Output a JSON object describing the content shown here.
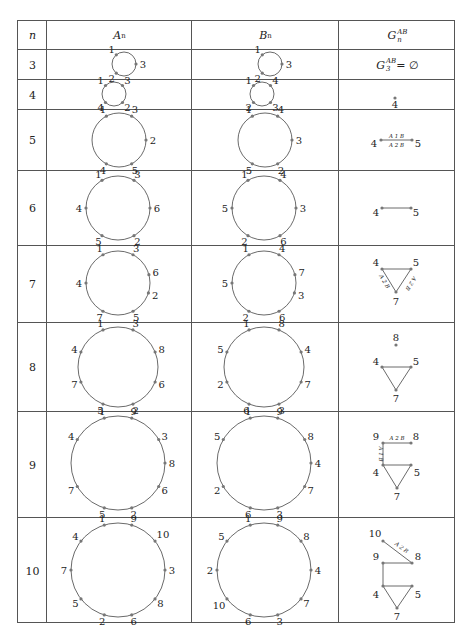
{
  "table": {
    "headers": {
      "n": "n",
      "a": "A",
      "a_sub": "n",
      "b": "B",
      "b_sub": "n",
      "g": "G",
      "g_sub": "n",
      "g_sup": "AB"
    },
    "rows": [
      {
        "n": "3",
        "A": {
          "cx": 124,
          "cy": 64,
          "r": 12,
          "nodes": [
            {
              "l": "1",
              "a": -130
            },
            {
              "l": "3",
              "a": 0
            },
            {
              "l": "2",
              "a": 130
            }
          ]
        },
        "B": {
          "cx": 270,
          "cy": 64,
          "r": 12,
          "nodes": [
            {
              "l": "1",
              "a": -130
            },
            {
              "l": "3",
              "a": 0
            },
            {
              "l": "2",
              "a": 130
            }
          ]
        },
        "G": {
          "text_main": "G",
          "text_sub": "3",
          "text_sup": "AB",
          "text_rest": " = ∅"
        }
      },
      {
        "n": "4",
        "A": {
          "cx": 114,
          "cy": 94,
          "r": 12,
          "nodes": [
            {
              "l": "1",
              "a": -135
            },
            {
              "l": "3",
              "a": -45
            },
            {
              "l": "2",
              "a": 45
            },
            {
              "l": "4",
              "a": 135
            }
          ]
        },
        "B": {
          "cx": 262,
          "cy": 94,
          "r": 12,
          "nodes": [
            {
              "l": "1",
              "a": -135
            },
            {
              "l": "4",
              "a": -45
            },
            {
              "l": "3",
              "a": 45
            },
            {
              "l": "2",
              "a": 135
            }
          ]
        },
        "G": {
          "nodes": [
            {
              "l": "4",
              "x": 395,
              "y": 98,
              "lx": 395,
              "ly": 108
            }
          ],
          "edges": []
        }
      },
      {
        "n": "5",
        "A": {
          "cx": 119,
          "cy": 140,
          "r": 27,
          "nodes": [
            {
              "l": "1",
              "a": -118
            },
            {
              "l": "3",
              "a": -62
            },
            {
              "l": "2",
              "a": 0
            },
            {
              "l": "5",
              "a": 62
            },
            {
              "l": "4",
              "a": 118
            }
          ]
        },
        "B": {
          "cx": 265,
          "cy": 140,
          "r": 27,
          "nodes": [
            {
              "l": "1",
              "a": -118
            },
            {
              "l": "4",
              "a": -62
            },
            {
              "l": "3",
              "a": 0
            },
            {
              "l": "2",
              "a": 62
            },
            {
              "l": "5",
              "a": 118
            }
          ]
        },
        "G": {
          "nodes": [
            {
              "l": "4",
              "x": 381,
              "y": 140,
              "lx": 374,
              "ly": 147
            },
            {
              "l": "5",
              "x": 412,
              "y": 140,
              "lx": 418,
              "ly": 147
            }
          ],
          "edges": [
            {
              "from": 0,
              "to": 1,
              "top": "A  1  B",
              "bottom": "A  2  B"
            }
          ]
        }
      },
      {
        "n": "6",
        "A": {
          "cx": 118,
          "cy": 208,
          "r": 32,
          "nodes": [
            {
              "l": "1",
              "a": -120
            },
            {
              "l": "3",
              "a": -60
            },
            {
              "l": "6",
              "a": 0
            },
            {
              "l": "2",
              "a": 60
            },
            {
              "l": "5",
              "a": 120
            },
            {
              "l": "4",
              "a": 180
            }
          ]
        },
        "B": {
          "cx": 264,
          "cy": 208,
          "r": 32,
          "nodes": [
            {
              "l": "1",
              "a": -120
            },
            {
              "l": "4",
              "a": -60
            },
            {
              "l": "3",
              "a": 0
            },
            {
              "l": "6",
              "a": 60
            },
            {
              "l": "2",
              "a": 120
            },
            {
              "l": "5",
              "a": 180
            }
          ]
        },
        "G": {
          "nodes": [
            {
              "l": "4",
              "x": 382,
              "y": 208,
              "lx": 376,
              "ly": 216
            },
            {
              "l": "5",
              "x": 411,
              "y": 208,
              "lx": 416,
              "ly": 216
            }
          ],
          "edges": [
            {
              "from": 0,
              "to": 1
            }
          ]
        }
      },
      {
        "n": "7",
        "A": {
          "cx": 118,
          "cy": 283,
          "r": 32,
          "nodes": [
            {
              "l": "1",
              "a": -118
            },
            {
              "l": "3",
              "a": -62
            },
            {
              "l": "6",
              "a": -15
            },
            {
              "l": "2",
              "a": 18
            },
            {
              "l": "5",
              "a": 62
            },
            {
              "l": "7",
              "a": 118
            },
            {
              "l": "4",
              "a": 180
            }
          ]
        },
        "B": {
          "cx": 264,
          "cy": 283,
          "r": 32,
          "nodes": [
            {
              "l": "1",
              "a": -118
            },
            {
              "l": "4",
              "a": -62
            },
            {
              "l": "7",
              "a": -15
            },
            {
              "l": "3",
              "a": 18
            },
            {
              "l": "6",
              "a": 62
            },
            {
              "l": "2",
              "a": 118
            },
            {
              "l": "5",
              "a": 180
            }
          ]
        },
        "G": {
          "nodes": [
            {
              "l": "4",
              "x": 382,
              "y": 269,
              "lx": 376,
              "ly": 266
            },
            {
              "l": "5",
              "x": 411,
              "y": 269,
              "lx": 416,
              "ly": 266
            },
            {
              "l": "7",
              "x": 396,
              "y": 292,
              "lx": 396,
              "ly": 305
            }
          ],
          "edges": [
            {
              "from": 0,
              "to": 1
            },
            {
              "from": 0,
              "to": 2,
              "label": "A 2 B",
              "side": "left"
            },
            {
              "from": 1,
              "to": 2,
              "label": "A 2 B",
              "side": "right"
            }
          ]
        }
      },
      {
        "n": "8",
        "A": {
          "cx": 118,
          "cy": 367,
          "r": 40,
          "nodes": [
            {
              "l": "1",
              "a": -112
            },
            {
              "l": "3",
              "a": -68
            },
            {
              "l": "8",
              "a": -22
            },
            {
              "l": "6",
              "a": 22
            },
            {
              "l": "2",
              "a": 68
            },
            {
              "l": "5",
              "a": 112
            },
            {
              "l": "7",
              "a": 158
            },
            {
              "l": "4",
              "a": -158
            }
          ]
        },
        "B": {
          "cx": 264,
          "cy": 367,
          "r": 40,
          "nodes": [
            {
              "l": "1",
              "a": -112
            },
            {
              "l": "8",
              "a": -68
            },
            {
              "l": "4",
              "a": -22
            },
            {
              "l": "7",
              "a": 22
            },
            {
              "l": "3",
              "a": 68
            },
            {
              "l": "6",
              "a": 112
            },
            {
              "l": "2",
              "a": 158
            },
            {
              "l": "5",
              "a": -158
            }
          ]
        },
        "G": {
          "nodes": [
            {
              "l": "8",
              "x": 396,
              "y": 345,
              "lx": 396,
              "ly": 341
            },
            {
              "l": "4",
              "x": 382,
              "y": 367,
              "lx": 376,
              "ly": 365
            },
            {
              "l": "5",
              "x": 411,
              "y": 367,
              "lx": 416,
              "ly": 365
            },
            {
              "l": "7",
              "x": 396,
              "y": 390,
              "lx": 396,
              "ly": 402
            }
          ],
          "edges": [
            {
              "from": 1,
              "to": 2
            },
            {
              "from": 1,
              "to": 3
            },
            {
              "from": 2,
              "to": 3
            }
          ]
        }
      },
      {
        "n": "9",
        "A": {
          "cx": 118,
          "cy": 463,
          "r": 47,
          "nodes": [
            {
              "l": "1",
              "a": -107
            },
            {
              "l": "9",
              "a": -73
            },
            {
              "l": "3",
              "a": -30
            },
            {
              "l": "8",
              "a": 0
            },
            {
              "l": "6",
              "a": 30
            },
            {
              "l": "2",
              "a": 73
            },
            {
              "l": "5",
              "a": 107
            },
            {
              "l": "7",
              "a": 150
            },
            {
              "l": "4",
              "a": -150
            }
          ]
        },
        "B": {
          "cx": 264,
          "cy": 463,
          "r": 47,
          "nodes": [
            {
              "l": "1",
              "a": -107
            },
            {
              "l": "9",
              "a": -73
            },
            {
              "l": "8",
              "a": -30
            },
            {
              "l": "4",
              "a": 0
            },
            {
              "l": "7",
              "a": 30
            },
            {
              "l": "3",
              "a": 73
            },
            {
              "l": "6",
              "a": 107
            },
            {
              "l": "2",
              "a": 150
            },
            {
              "l": "5",
              "a": -150
            }
          ]
        },
        "G": {
          "nodes": [
            {
              "l": "9",
              "x": 383,
              "y": 443,
              "lx": 376,
              "ly": 440
            },
            {
              "l": "8",
              "x": 411,
              "y": 443,
              "lx": 416,
              "ly": 440
            },
            {
              "l": "4",
              "x": 383,
              "y": 465,
              "lx": 376,
              "ly": 476
            },
            {
              "l": "5",
              "x": 411,
              "y": 465,
              "lx": 417,
              "ly": 476
            },
            {
              "l": "7",
              "x": 397,
              "y": 488,
              "lx": 397,
              "ly": 500
            }
          ],
          "edges": [
            {
              "from": 0,
              "to": 1,
              "label": "A  2  B",
              "side": "top"
            },
            {
              "from": 0,
              "to": 2,
              "label": "A 1 B",
              "side": "leftv"
            },
            {
              "from": 2,
              "to": 3
            },
            {
              "from": 2,
              "to": 4
            },
            {
              "from": 3,
              "to": 4
            }
          ]
        }
      },
      {
        "n": "10",
        "A": {
          "cx": 118,
          "cy": 570,
          "r": 47,
          "nodes": [
            {
              "l": "1",
              "a": -107
            },
            {
              "l": "9",
              "a": -73
            },
            {
              "l": "10",
              "a": -38
            },
            {
              "l": "3",
              "a": 0
            },
            {
              "l": "8",
              "a": 38
            },
            {
              "l": "6",
              "a": 73
            },
            {
              "l": "2",
              "a": 107
            },
            {
              "l": "5",
              "a": 142
            },
            {
              "l": "7",
              "a": 180
            },
            {
              "l": "4",
              "a": -142
            }
          ]
        },
        "B": {
          "cx": 264,
          "cy": 570,
          "r": 47,
          "nodes": [
            {
              "l": "1",
              "a": -107
            },
            {
              "l": "9",
              "a": -73
            },
            {
              "l": "8",
              "a": -38
            },
            {
              "l": "4",
              "a": 0
            },
            {
              "l": "7",
              "a": 38
            },
            {
              "l": "3",
              "a": 73
            },
            {
              "l": "6",
              "a": 107
            },
            {
              "l": "10",
              "a": 142
            },
            {
              "l": "2",
              "a": 180
            },
            {
              "l": "5",
              "a": -142
            }
          ]
        },
        "G": {
          "nodes": [
            {
              "l": "10",
              "x": 383,
              "y": 541,
              "lx": 375,
              "ly": 537
            },
            {
              "l": "8",
              "x": 412,
              "y": 563,
              "lx": 418,
              "ly": 560
            },
            {
              "l": "9",
              "x": 383,
              "y": 563,
              "lx": 376,
              "ly": 560
            },
            {
              "l": "4",
              "x": 383,
              "y": 586,
              "lx": 376,
              "ly": 598
            },
            {
              "l": "5",
              "x": 412,
              "y": 586,
              "lx": 418,
              "ly": 598
            },
            {
              "l": "7",
              "x": 397,
              "y": 608,
              "lx": 397,
              "ly": 620
            }
          ],
          "edges": [
            {
              "from": 0,
              "to": 1,
              "label": "A 2 B",
              "side": "diag"
            },
            {
              "from": 2,
              "to": 1
            },
            {
              "from": 2,
              "to": 3
            },
            {
              "from": 3,
              "to": 4
            },
            {
              "from": 3,
              "to": 5
            },
            {
              "from": 4,
              "to": 5
            }
          ]
        }
      }
    ]
  },
  "layout": {
    "col_x": [
      17,
      46,
      191,
      338,
      455
    ],
    "row_y": [
      20,
      49,
      79,
      109,
      170,
      245,
      322,
      411,
      517,
      623
    ]
  },
  "colors": {
    "border": "#555555",
    "edge": "#444444",
    "node": "#777777",
    "text": "#222222"
  }
}
